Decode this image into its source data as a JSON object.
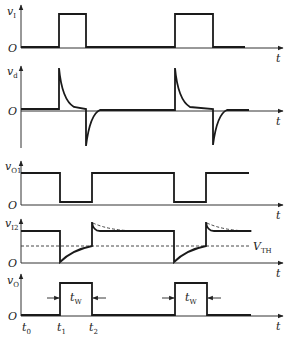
{
  "diagram": {
    "title": "",
    "panels": [
      {
        "id": "vI",
        "y_label": "v",
        "y_sub": "I",
        "origin": "O",
        "x_label": "t"
      },
      {
        "id": "vd",
        "y_label": "v",
        "y_sub": "d",
        "origin": "O",
        "x_label": "t"
      },
      {
        "id": "vO1",
        "y_label": "v",
        "y_sub": "O1",
        "origin": "O",
        "x_label": "t"
      },
      {
        "id": "vI2",
        "y_label": "v",
        "y_sub": "I2",
        "origin": "O",
        "x_label": "t",
        "threshold_label": "V",
        "threshold_sub": "TH"
      },
      {
        "id": "vO",
        "y_label": "v",
        "y_sub": "O",
        "origin": "O",
        "x_label": "t"
      }
    ],
    "pulse_width_label": "t",
    "pulse_width_sub": "W",
    "time_marks": [
      {
        "label": "t",
        "sub": "0"
      },
      {
        "label": "t",
        "sub": "1"
      },
      {
        "label": "t",
        "sub": "2"
      }
    ]
  }
}
